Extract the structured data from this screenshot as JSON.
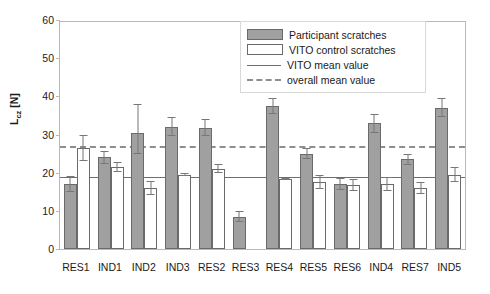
{
  "chart_data": {
    "type": "bar",
    "title": "",
    "xlabel": "",
    "ylabel": "L",
    "ylabel_sub": "cz",
    "ylabel_unit": " [N]",
    "ylim": [
      0,
      60
    ],
    "yticks": [
      60,
      50,
      40,
      30,
      20,
      10,
      0
    ],
    "grid": false,
    "legend_position": "top-right",
    "categories": [
      "RES1",
      "IND1",
      "IND2",
      "IND3",
      "RES2",
      "RES3",
      "RES4",
      "RES5",
      "RES6",
      "IND4",
      "RES7",
      "IND5"
    ],
    "series": [
      {
        "name": "Participant scratches",
        "color": "#a0a0a0",
        "values": [
          17.0,
          24.0,
          30.5,
          32.0,
          31.8,
          8.5,
          37.5,
          25.0,
          17.0,
          33.0,
          23.5,
          37.0
        ],
        "err_low": [
          2.0,
          1.8,
          5.5,
          2.5,
          2.2,
          1.5,
          2.0,
          1.5,
          1.5,
          2.5,
          1.5,
          2.5
        ],
        "err_high": [
          2.0,
          1.8,
          7.5,
          2.5,
          2.2,
          1.5,
          2.0,
          1.5,
          1.5,
          2.5,
          1.5,
          2.5
        ]
      },
      {
        "name": "VITO control scratches",
        "color": "#ffffff",
        "values": [
          26.5,
          21.5,
          16.0,
          19.5,
          21.0,
          null,
          18.3,
          17.5,
          16.8,
          17.0,
          16.0,
          19.5
        ],
        "err_low": [
          3.5,
          1.2,
          1.8,
          0.4,
          1.2,
          null,
          0.3,
          1.8,
          1.5,
          1.8,
          1.5,
          2.0
        ],
        "err_high": [
          3.5,
          1.2,
          1.8,
          0.4,
          1.2,
          null,
          0.3,
          1.8,
          1.5,
          1.8,
          1.5,
          2.0
        ]
      }
    ],
    "reference_lines": [
      {
        "name": "VITO mean value",
        "value": 18.5,
        "style": "solid",
        "color": "#6e6e6e"
      },
      {
        "name": "overall mean value",
        "value": 26.5,
        "style": "dashed",
        "color": "#8e8e8e"
      }
    ]
  },
  "legend": {
    "items": [
      {
        "label": "Participant scratches",
        "key": "swatch-filled"
      },
      {
        "label": "VITO control scratches",
        "key": "swatch-open"
      },
      {
        "label": "VITO mean value",
        "key": "line-solid"
      },
      {
        "label": "overall mean value",
        "key": "line-dashed"
      }
    ]
  }
}
